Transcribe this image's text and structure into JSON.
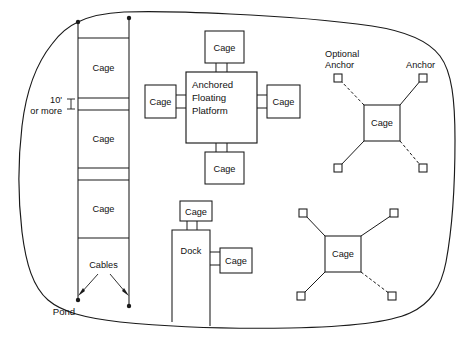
{
  "diagram": {
    "pond_label": "Pond",
    "colors": {
      "ink": "#1a1a1a",
      "paper": "#ffffff"
    }
  },
  "cable_system": {
    "cables_label": "Cables",
    "spacing_line1": "10'",
    "spacing_line2": "or more",
    "cage_labels": [
      "Cage",
      "Cage",
      "Cage"
    ]
  },
  "platform_group": {
    "platform_label_line1": "Anchored",
    "platform_label_line2": "Floating",
    "platform_label_line3": "Platform",
    "cage_top": "Cage",
    "cage_left": "Cage",
    "cage_right": "Cage",
    "cage_bottom": "Cage"
  },
  "dock_group": {
    "dock_label": "Dock",
    "cage_top": "Cage",
    "cage_right": "Cage"
  },
  "anchor_group_upper": {
    "cage_label": "Cage",
    "optional_anchor_line1": "Optional",
    "optional_anchor_line2": "Anchor",
    "anchor_label": "Anchor"
  },
  "anchor_group_lower": {
    "cage_label": "Cage"
  }
}
